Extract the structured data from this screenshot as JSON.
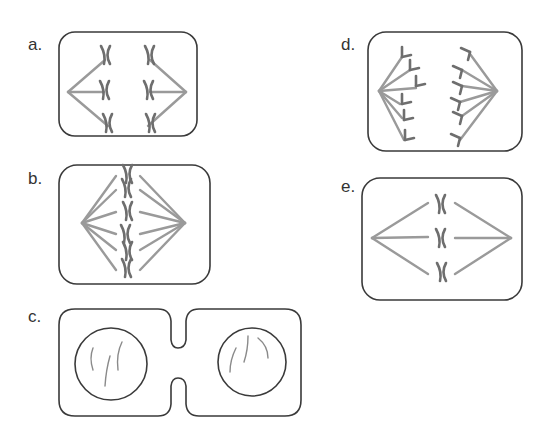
{
  "colors": {
    "outline": "#3a3a3a",
    "spindle": "#9a9a9a",
    "chromosome": "#6e6e6e",
    "label": "#333333"
  },
  "panels": [
    {
      "id": "a",
      "label": "a.",
      "stage": "anaphase-early",
      "label_pos": [
        28,
        36
      ]
    },
    {
      "id": "b",
      "label": "b.",
      "stage": "metaphase",
      "label_pos": [
        28,
        170
      ]
    },
    {
      "id": "c",
      "label": "c.",
      "stage": "telophase-cytokinesis",
      "label_pos": [
        28,
        308
      ]
    },
    {
      "id": "d",
      "label": "d.",
      "stage": "anaphase-late",
      "label_pos": [
        341,
        36
      ]
    },
    {
      "id": "e",
      "label": "e.",
      "stage": "metaphase-few-chromosomes",
      "label_pos": [
        341,
        178
      ]
    }
  ]
}
